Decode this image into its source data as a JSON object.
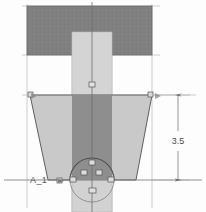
{
  "drawing": {
    "title": "Structural Footing Elevation View",
    "view_type": "front-elevation",
    "background_color": "#fdfdfd"
  },
  "colors": {
    "dark_fill": "#808080",
    "mid_fill": "#989898",
    "light_fill": "#cccccc",
    "lighter_fill": "#d6d6d6",
    "outline": "#5a5a5a",
    "construction_line": "#b9b9b9",
    "centerline": "#8d8d8d",
    "dimension_line": "#7b7b7b",
    "text": "#4a4a4a"
  },
  "geometry": {
    "cap_plate": {
      "name": "top-cap-plate",
      "x": 27,
      "y": 6,
      "width": 125,
      "height": 49,
      "fill": "#808080"
    },
    "column": {
      "name": "vertical-column",
      "x": 72,
      "y": 32,
      "width": 40,
      "height": 180,
      "fill": "#d6d6d6"
    },
    "column_shaded": {
      "name": "column-shaded-band",
      "x": 72,
      "y": 95,
      "width": 40,
      "height": 85,
      "fill": "#8e8e8e"
    },
    "trapezoid": {
      "name": "tapered-footing",
      "points": "30,95 152,95 136,180 48,180",
      "fill": "#c6c6c6",
      "stroke": "#5a5a5a"
    },
    "pedestal": {
      "name": "base-pedestal",
      "x": 72,
      "y": 180,
      "width": 40,
      "height": 32,
      "fill": "#d2d2d2"
    },
    "anchor_arc": {
      "name": "anchor-bolt-arc",
      "cx": 92,
      "cy": 180,
      "r": 22
    }
  },
  "centerline": {
    "name": "vertical-centerline",
    "x": 92,
    "y1": 2,
    "y2": 212
  },
  "construction_lines": [
    {
      "name": "left-extension-line",
      "x1": 27,
      "y1": 4,
      "x2": 27,
      "y2": 208,
      "orient": "v"
    },
    {
      "name": "right-extension-line",
      "x1": 152,
      "y1": 4,
      "x2": 152,
      "y2": 208,
      "orient": "v"
    },
    {
      "name": "cap-top-line",
      "x1": 22,
      "y1": 6,
      "x2": 158,
      "y2": 6,
      "orient": "h"
    },
    {
      "name": "cap-bottom-line",
      "x1": 22,
      "y1": 55,
      "x2": 158,
      "y2": 55,
      "orient": "h"
    },
    {
      "name": "footing-top-line",
      "x1": 22,
      "y1": 95,
      "x2": 196,
      "y2": 95,
      "orient": "h"
    },
    {
      "name": "baseline-line",
      "x1": 4,
      "y1": 180,
      "x2": 202,
      "y2": 180,
      "orient": "h"
    }
  ],
  "vertices": [
    {
      "name": "vertex-footing-top-left",
      "x": 31,
      "y": 95
    },
    {
      "name": "vertex-footing-top-right",
      "x": 151,
      "y": 95
    },
    {
      "name": "vertex-column-mid",
      "x": 92,
      "y": 85
    },
    {
      "name": "vertex-anchor-top",
      "x": 92,
      "y": 163
    },
    {
      "name": "vertex-anchor-left",
      "x": 84,
      "y": 173
    },
    {
      "name": "vertex-anchor-right",
      "x": 99,
      "y": 173
    },
    {
      "name": "vertex-base-left-outer",
      "x": 60,
      "y": 181
    },
    {
      "name": "vertex-base-left-inner",
      "x": 73,
      "y": 180
    },
    {
      "name": "vertex-base-right",
      "x": 111,
      "y": 180
    },
    {
      "name": "vertex-base-center",
      "x": 92,
      "y": 190
    }
  ],
  "dimensions": [
    {
      "name": "vertical-height-dimension",
      "value": "3.5",
      "x": 178,
      "y1": 95,
      "y2": 180,
      "text_x": 178,
      "text_y": 141,
      "leader_from_x": 152,
      "leader_to_x": 188
    }
  ],
  "labels": [
    {
      "name": "datum-label-a1",
      "text": "A_1",
      "x": 30,
      "y": 183
    }
  ],
  "datum_line": {
    "name": "datum-horizontal-line",
    "x1": 6,
    "y1": 180,
    "x2": 200,
    "y2": 180
  }
}
